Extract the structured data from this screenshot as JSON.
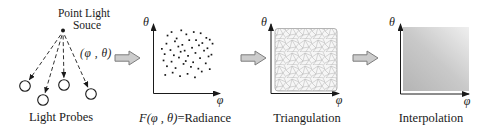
{
  "figure": {
    "panel1": {
      "title_line1": "Point Light",
      "title_line2": "Souce",
      "angle_label": "(φ , θ)",
      "caption": "Light Probes",
      "probe_count": 4
    },
    "axes": {
      "x_label": "φ",
      "y_label": "θ"
    },
    "panel2": {
      "formula": "F(φ , θ)",
      "suffix": "=Radiance"
    },
    "panel3": {
      "caption": "Triangulation"
    },
    "panel4": {
      "caption": "Interpolation"
    },
    "colors": {
      "ink": "#1a1a1a",
      "flow_arrow_fill": "#cccccc",
      "flow_arrow_stroke": "#7d7d7d",
      "mesh_line": "#b6b6b6",
      "interp_dark": "#b4b4b4",
      "interp_light": "#efefef"
    }
  },
  "chart_data": {
    "type": "scatter",
    "title": "F(φ , θ)=Radiance",
    "xlabel": "φ",
    "ylabel": "θ",
    "axis_range_note": "axes unlabeled, points shown as percent of plot box, y measured from top",
    "points_pct": [
      [
        22,
        7
      ],
      [
        39,
        4
      ],
      [
        15,
        13
      ],
      [
        31,
        18
      ],
      [
        48,
        11
      ],
      [
        61,
        7
      ],
      [
        73,
        9
      ],
      [
        83,
        17
      ],
      [
        65,
        21
      ],
      [
        13,
        27
      ],
      [
        28,
        23
      ],
      [
        41,
        29
      ],
      [
        53,
        21
      ],
      [
        76,
        26
      ],
      [
        89,
        20
      ],
      [
        5,
        36
      ],
      [
        20,
        38
      ],
      [
        34,
        32
      ],
      [
        45,
        39
      ],
      [
        58,
        34
      ],
      [
        70,
        30
      ],
      [
        85,
        35
      ],
      [
        94,
        27
      ],
      [
        10,
        45
      ],
      [
        26,
        47
      ],
      [
        38,
        41
      ],
      [
        51,
        48
      ],
      [
        64,
        43
      ],
      [
        79,
        39
      ],
      [
        92,
        46
      ],
      [
        8,
        56
      ],
      [
        22,
        58
      ],
      [
        35,
        51
      ],
      [
        47,
        57
      ],
      [
        60,
        59
      ],
      [
        72,
        52
      ],
      [
        87,
        49
      ],
      [
        14,
        66
      ],
      [
        29,
        69
      ],
      [
        43,
        62
      ],
      [
        56,
        67
      ],
      [
        69,
        70
      ],
      [
        82,
        61
      ],
      [
        24,
        77
      ],
      [
        50,
        79
      ],
      [
        75,
        75
      ],
      [
        37,
        83
      ],
      [
        63,
        85
      ],
      [
        89,
        71
      ],
      [
        11,
        81
      ]
    ]
  }
}
